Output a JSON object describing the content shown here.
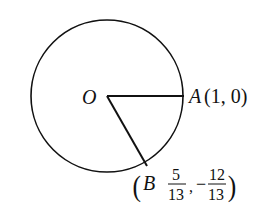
{
  "diagram": {
    "type": "unit-circle",
    "circle": {
      "center_label": "O"
    },
    "points": [
      {
        "name": "A",
        "label": "A",
        "coords_text": "(1, 0)",
        "x": "1",
        "y": "0"
      },
      {
        "name": "B",
        "label": "B",
        "x_num": "5",
        "x_den": "13",
        "y_sign": "−",
        "y_num": "12",
        "y_den": "13"
      }
    ],
    "segments": [
      "OA",
      "OB"
    ],
    "separator": ","
  }
}
